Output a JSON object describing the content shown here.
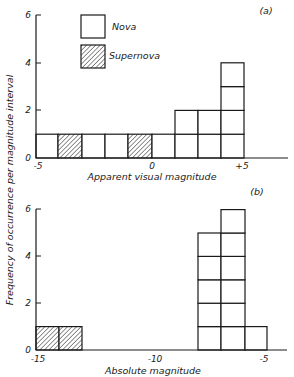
{
  "figure": {
    "ylabel": "Frequency of occurrence per magnitude interval",
    "legend": [
      {
        "label": "Nova",
        "fill": "open"
      },
      {
        "label": "Supernova",
        "fill": "hatched"
      }
    ]
  },
  "chart_data": [
    {
      "type": "bar",
      "panel": "(a)",
      "title": "",
      "xlabel": "Apparent visual magnitude",
      "ylabel": "Frequency of occurrence per magnitude interval",
      "x_tick_labels": [
        "-5",
        "0",
        "+5"
      ],
      "y_tick_labels": [
        "0",
        "2",
        "4",
        "6"
      ],
      "ylim": [
        0,
        6
      ],
      "xlim": [
        -5,
        6.5
      ],
      "grid": false,
      "legend_position": "upper-left-inside",
      "bins": [
        {
          "range": [
            -5,
            -4
          ],
          "type": "Nova",
          "count": 1
        },
        {
          "range": [
            -4,
            -3
          ],
          "type": "Supernova",
          "count": 1
        },
        {
          "range": [
            -3,
            -2
          ],
          "type": "Nova",
          "count": 1
        },
        {
          "range": [
            -2,
            -1
          ],
          "type": "Nova",
          "count": 1
        },
        {
          "range": [
            -1,
            0
          ],
          "type": "Supernova",
          "count": 1
        },
        {
          "range": [
            0,
            1
          ],
          "type": "Nova",
          "count": 1
        },
        {
          "range": [
            1,
            2
          ],
          "type": "Nova",
          "count": 2
        },
        {
          "range": [
            2,
            3
          ],
          "type": "Nova",
          "count": 2
        },
        {
          "range": [
            3,
            4
          ],
          "type": "Nova",
          "count": 4
        }
      ],
      "series": [
        {
          "name": "Nova",
          "total": 12
        },
        {
          "name": "Supernova",
          "total": 2
        }
      ]
    },
    {
      "type": "bar",
      "panel": "(b)",
      "title": "",
      "xlabel": "Absolute magnitude",
      "ylabel": "Frequency of occurrence per magnitude interval",
      "x_tick_labels": [
        "-15",
        "-10",
        "-5"
      ],
      "y_tick_labels": [
        "0",
        "2",
        "4",
        "6"
      ],
      "ylim": [
        0,
        6
      ],
      "xlim": [
        -15,
        -4
      ],
      "grid": false,
      "bins": [
        {
          "range": [
            -15,
            -14
          ],
          "type": "Supernova",
          "count": 1
        },
        {
          "range": [
            -14,
            -13
          ],
          "type": "Supernova",
          "count": 1
        },
        {
          "range": [
            -8,
            -7
          ],
          "type": "Nova",
          "count": 5
        },
        {
          "range": [
            -7,
            -6
          ],
          "type": "Nova",
          "count": 6
        },
        {
          "range": [
            -6,
            -5
          ],
          "type": "Nova",
          "count": 1
        }
      ],
      "series": [
        {
          "name": "Nova",
          "total": 12
        },
        {
          "name": "Supernova",
          "total": 2
        }
      ]
    }
  ],
  "layout": {
    "panels": [
      {
        "axis_x0": 36,
        "axis_right": 288,
        "base_y": 158,
        "unit_h": 23.8,
        "y_ticks": [
          {
            "v": 0,
            "y": 158
          },
          {
            "v": 2,
            "y": 110
          },
          {
            "v": 4,
            "y": 63
          },
          {
            "v": 6,
            "y": 15
          }
        ],
        "box_edges": [
          36,
          58,
          82,
          105,
          128,
          152,
          175,
          198,
          221,
          244
        ],
        "x_labels": [
          {
            "x": 38,
            "text_idx": 0
          },
          {
            "x": 152,
            "text_idx": 1
          },
          {
            "x": 242,
            "text_idx": 2
          }
        ],
        "x_label_y": 169,
        "xtitle_x": 152,
        "xtitle_y": 180,
        "panel_label_x": 266,
        "panel_label_y": 14
      },
      {
        "axis_x0": 36,
        "axis_right": 287,
        "base_y": 350,
        "unit_h": 23.4,
        "y_ticks": [
          {
            "v": 0,
            "y": 350
          },
          {
            "v": 2,
            "y": 303
          },
          {
            "v": 4,
            "y": 256
          },
          {
            "v": 6,
            "y": 209
          }
        ],
        "box_edges_map": [
          [
            36,
            59
          ],
          [
            59,
            82
          ],
          [
            198,
            221
          ],
          [
            221,
            245
          ],
          [
            245,
            267
          ]
        ],
        "x_labels": [
          {
            "x": 38,
            "text_idx": 0
          },
          {
            "x": 155,
            "text_idx": 1
          },
          {
            "x": 264,
            "text_idx": 2
          }
        ],
        "x_label_y": 362,
        "xtitle_x": 153,
        "xtitle_y": 374,
        "panel_label_x": 257,
        "panel_label_y": 195
      }
    ]
  }
}
